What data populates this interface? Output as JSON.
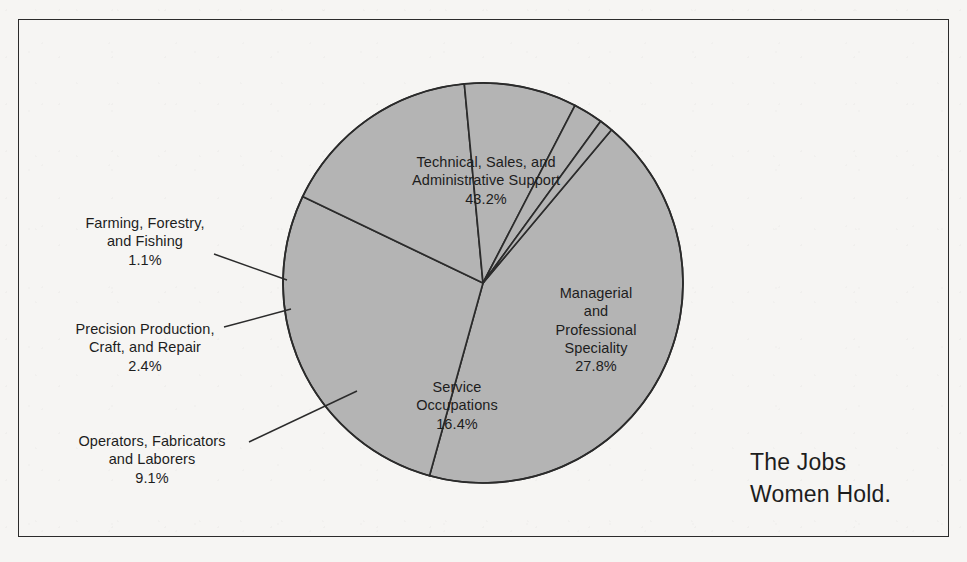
{
  "chart_data": {
    "type": "pie",
    "title": "The Jobs Women Hold.",
    "xlabel": "",
    "ylabel": "",
    "units": "percent",
    "legend_position": "none",
    "grid": false,
    "categories": [
      "Technical, Sales, and Administrative Support",
      "Managerial and Professional Speciality",
      "Service Occupations",
      "Operators, Fabricators and Laborers",
      "Precision Production, Craft, and Repair",
      "Farming, Forestry, and Fishing"
    ],
    "values": [
      43.2,
      27.8,
      16.4,
      9.1,
      2.4,
      1.1
    ],
    "slices": [
      {
        "name": "Technical, Sales, and Administrative Support",
        "value": 43.2,
        "label": "Technical, Sales, and\nAdministrative Support\n43.2%",
        "label_placement": "inside"
      },
      {
        "name": "Managerial and Professional Speciality",
        "value": 27.8,
        "label": "Managerial\nand\nProfessional\nSpeciality\n27.8%",
        "label_placement": "inside"
      },
      {
        "name": "Service Occupations",
        "value": 16.4,
        "label": "Service\nOccupations\n16.4%",
        "label_placement": "inside"
      },
      {
        "name": "Operators, Fabricators and Laborers",
        "value": 9.1,
        "label": "Operators, Fabricators\nand Laborers\n9.1%",
        "label_placement": "callout"
      },
      {
        "name": "Precision Production, Craft, and Repair",
        "value": 2.4,
        "label": "Precision Production,\nCraft, and Repair\n2.4%",
        "label_placement": "callout"
      },
      {
        "name": "Farming, Forestry, and Fishing",
        "value": 1.1,
        "label": "Farming, Forestry,\nand Fishing\n1.1%",
        "label_placement": "callout"
      }
    ],
    "colors": {
      "slice_fill": "#b4b4b4",
      "slice_stroke": "#2b2b2b",
      "background": "#f6f5f3",
      "text": "#1d1d1d",
      "frame": "#2b2b2b"
    }
  },
  "figure": {
    "caption": "The Jobs\nWomen Hold."
  }
}
